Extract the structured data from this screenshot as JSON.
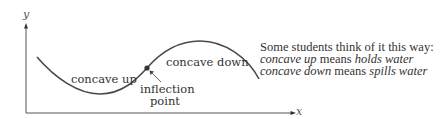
{
  "diagram": {
    "axes": {
      "y_label": "y",
      "x_label": "x"
    },
    "curve_labels": {
      "concave_up": "concave up",
      "concave_down": "concave down",
      "inflection_line1": "inflection",
      "inflection_line2": "point"
    },
    "note": {
      "heading": "Some students think of it this way:",
      "line1": {
        "term": "concave up",
        "connector": " means ",
        "meaning": "holds water"
      },
      "line2": {
        "term": "concave down",
        "connector": " means ",
        "meaning": "spills water"
      }
    },
    "colors": {
      "curve": "#4a4a4a",
      "axis": "#555555",
      "point": "#333333",
      "text": "#333333"
    }
  }
}
